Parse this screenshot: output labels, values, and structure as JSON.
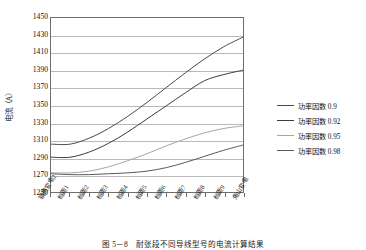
{
  "chart_data": {
    "type": "line",
    "title": "",
    "xlabel": "",
    "ylabel": "电流（A）",
    "ylim": [
      1250,
      1450
    ],
    "ytick_step": 20,
    "yticks": [
      1450,
      1430,
      1410,
      1390,
      1370,
      1350,
      1330,
      1310,
      1290,
      1270,
      1250
    ],
    "grid": true,
    "legend_position": "right",
    "categories": [
      "镇赉变电2",
      "档距1",
      "档距2",
      "档距3",
      "档距4",
      "档距5",
      "档距6",
      "档距7",
      "档距8",
      "档距9",
      "角山变电"
    ],
    "series": [
      {
        "name": "功率因数 0.9",
        "color": "#4a4a4a",
        "values": [
          1305,
          1305,
          1312,
          1323,
          1337,
          1353,
          1370,
          1387,
          1403,
          1417,
          1428
        ]
      },
      {
        "name": "功率因数 0.92",
        "color": "#3c3c3c",
        "values": [
          1290,
          1290,
          1296,
          1306,
          1319,
          1334,
          1349,
          1364,
          1378,
          1385,
          1390
        ]
      },
      {
        "name": "功率因数 0.95",
        "color": "#a6a6a6",
        "values": [
          1272,
          1272,
          1274,
          1279,
          1286,
          1294,
          1303,
          1311,
          1318,
          1323,
          1326
        ]
      },
      {
        "name": "功率因数 0.98",
        "color": "#5a5a5a",
        "values": [
          1271,
          1270,
          1270,
          1271,
          1272,
          1274,
          1278,
          1284,
          1291,
          1298,
          1304
        ]
      }
    ],
    "caption": "图 5－8　耐张段不同导线型号的电流计算结果"
  },
  "legend": {
    "items": [
      {
        "label": "功率因数 0.9"
      },
      {
        "label": "功率因数 0.92"
      },
      {
        "label": "功率因数 0.95"
      },
      {
        "label": "功率因数 0.98"
      }
    ]
  },
  "axes": {
    "y_title": "电流（A）"
  },
  "figure": {
    "caption": "图 5－8　耐张段不同导线型号的电流计算结果"
  }
}
